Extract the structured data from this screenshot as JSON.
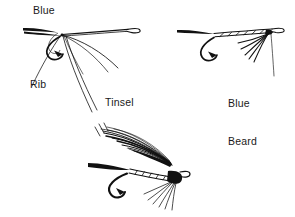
{
  "illustration": {
    "title": "Wet fly tying sequence",
    "background_color": "#ffffff",
    "ink_color": "#111111",
    "width": 295,
    "height": 217
  },
  "labels": {
    "blue": "Blue",
    "rib": "Rib",
    "tinsel": "Tinsel",
    "blue_beard_line1": "Blue",
    "blue_beard_line2": "Beard"
  },
  "figures": [
    {
      "id": "figure-top-left",
      "name": "hook-with-materials-tied-in",
      "parts": [
        "hook",
        "hook-eye",
        "hook-bend",
        "blue-floss",
        "rib-wire",
        "flat-tinsel"
      ]
    },
    {
      "id": "figure-top-right",
      "name": "hook-with-ribbed-body-and-beard",
      "parts": [
        "hook",
        "hook-eye",
        "hook-bend",
        "ribbed-body",
        "blue-beard-hackle",
        "tying-thread"
      ]
    },
    {
      "id": "figure-bottom",
      "name": "finished-winged-wet-fly",
      "parts": [
        "hook",
        "hook-eye",
        "hook-bend",
        "ribbed-body",
        "feather-wing",
        "throat-hackle",
        "head"
      ]
    }
  ]
}
